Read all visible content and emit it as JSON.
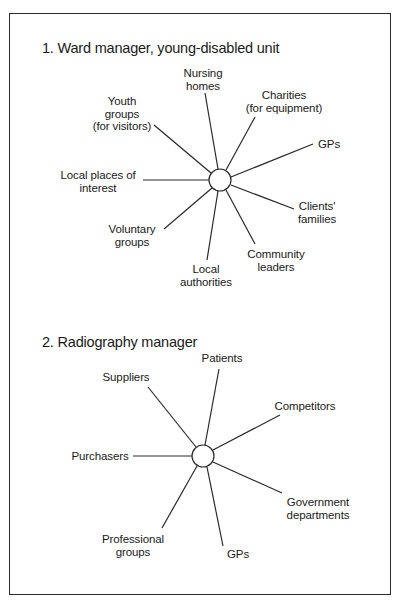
{
  "diagram1": {
    "title": "1. Ward manager, young-disabled unit",
    "labels": {
      "nursing_homes": [
        "Nursing",
        "homes"
      ],
      "charities": [
        "Charities",
        "(for equipment)"
      ],
      "youth_groups": [
        "Youth",
        "groups",
        "(for visitors)"
      ],
      "gps": [
        "GPs"
      ],
      "local_places": [
        "Local places of",
        "interest"
      ],
      "clients_families": [
        "Clients'",
        "families"
      ],
      "voluntary_groups": [
        "Voluntary",
        "groups"
      ],
      "community_leaders": [
        "Community",
        "leaders"
      ],
      "local_authorities": [
        "Local",
        "authorities"
      ]
    }
  },
  "diagram2": {
    "title": "2. Radiography manager",
    "labels": {
      "patients": [
        "Patients"
      ],
      "suppliers": [
        "Suppliers"
      ],
      "competitors": [
        "Competitors"
      ],
      "purchasers": [
        "Purchasers"
      ],
      "government_departments": [
        "Government",
        "departments"
      ],
      "professional_groups": [
        "Professional",
        "groups"
      ],
      "gps": [
        "GPs"
      ]
    }
  }
}
